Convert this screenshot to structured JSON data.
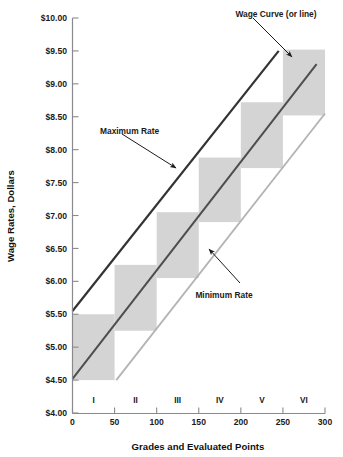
{
  "chart_data": {
    "type": "line",
    "title": "",
    "xlabel": "Grades and Evaluated Points",
    "ylabel": "Wage Rates, Dollars",
    "xlim": [
      0,
      300
    ],
    "ylim": [
      4.0,
      10.0
    ],
    "grid": false,
    "legend_position": "none",
    "x_ticks": [
      0,
      50,
      100,
      150,
      200,
      250,
      300
    ],
    "x_tick_labels": [
      "0",
      "50",
      "100",
      "150",
      "200",
      "250",
      "300"
    ],
    "y_ticks": [
      4.0,
      4.5,
      5.0,
      5.5,
      6.0,
      6.5,
      7.0,
      7.5,
      8.0,
      8.5,
      9.0,
      9.5,
      10.0
    ],
    "y_tick_labels": [
      "$4.00",
      "$4.50",
      "$5.00",
      "$5.50",
      "$6.00",
      "$6.50",
      "$7.00",
      "$7.50",
      "$8.00",
      "$8.50",
      "$9.00",
      "$9.50",
      "$10.00"
    ],
    "grade_labels": [
      "I",
      "II",
      "III",
      "IV",
      "V",
      "VI"
    ],
    "grade_label_x": [
      25,
      75,
      125,
      175,
      225,
      275
    ],
    "series": [
      {
        "name": "Maximum Rate",
        "color": "#333333",
        "width": 2.2,
        "x": [
          0,
          245
        ],
        "y": [
          5.55,
          9.5
        ]
      },
      {
        "name": "Wage Curve (or line)",
        "color": "#4d4d4d",
        "width": 2.0,
        "x": [
          0,
          290
        ],
        "y": [
          4.52,
          9.3
        ]
      },
      {
        "name": "Minimum Rate",
        "color": "#b3b3b3",
        "width": 1.8,
        "x": [
          52,
          300
        ],
        "y": [
          4.5,
          8.55
        ]
      }
    ],
    "rate_ranges": [
      {
        "grade": "I",
        "x0": 0,
        "x1": 50,
        "min": 4.5,
        "max": 5.5
      },
      {
        "grade": "II",
        "x0": 50,
        "x1": 100,
        "min": 5.25,
        "max": 6.25
      },
      {
        "grade": "III",
        "x0": 100,
        "x1": 150,
        "min": 6.05,
        "max": 7.05
      },
      {
        "grade": "IV",
        "x0": 150,
        "x1": 200,
        "min": 6.9,
        "max": 7.88
      },
      {
        "grade": "V",
        "x0": 200,
        "x1": 250,
        "min": 7.72,
        "max": 8.72
      },
      {
        "grade": "VI",
        "x0": 250,
        "x1": 300,
        "min": 8.52,
        "max": 9.52
      }
    ],
    "range_fill_color": "#d4d4d4",
    "annotations": [
      {
        "text": "Wage Curve (or line)",
        "text_x": 276,
        "text_y": 11,
        "anchor": "middle",
        "arrow_from_x": 253,
        "arrow_from_y": 18,
        "arrow_to_x": 292,
        "arrow_to_y": 57
      },
      {
        "text": "Maximum Rate",
        "text_x": 100,
        "text_y": 128,
        "anchor": "start",
        "arrow_from_x": 122,
        "arrow_from_y": 134,
        "arrow_to_x": 176,
        "arrow_to_y": 168
      },
      {
        "text": "Minimum Rate",
        "text_x": 224,
        "text_y": 292,
        "anchor": "middle",
        "arrow_from_x": 240,
        "arrow_from_y": 283,
        "arrow_to_x": 209,
        "arrow_to_y": 249
      }
    ]
  },
  "axis": {
    "y_title": "Wage Rates, Dollars",
    "x_title": "Grades and Evaluated Points"
  }
}
